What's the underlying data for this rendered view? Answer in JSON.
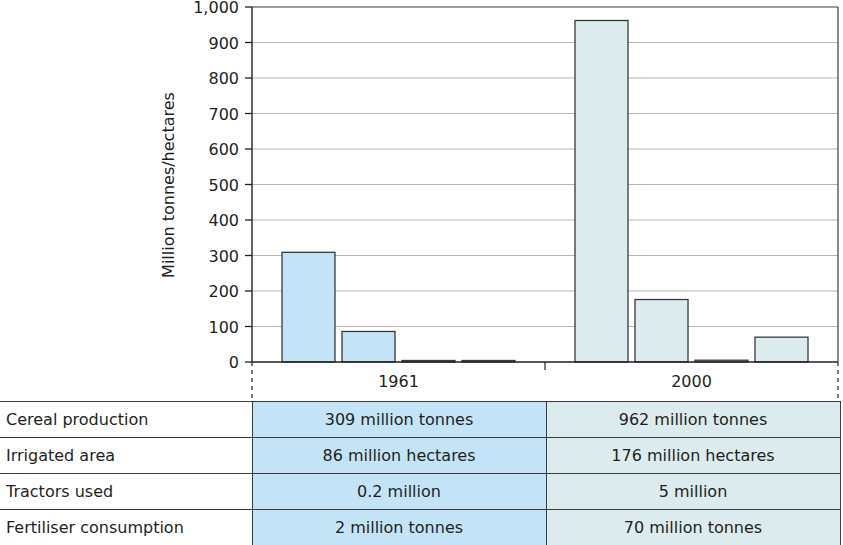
{
  "chart_data": {
    "type": "bar",
    "title": "",
    "xlabel": "",
    "ylabel": "Million tonnes/hectares",
    "ylim": [
      0,
      1000
    ],
    "yticks": [
      0,
      100,
      200,
      300,
      400,
      500,
      600,
      700,
      800,
      900,
      1000
    ],
    "ytick_labels": [
      "0",
      "100",
      "200",
      "300",
      "400",
      "500",
      "600",
      "700",
      "800",
      "900",
      "1,000"
    ],
    "grid": true,
    "categories": [
      "1961",
      "2000"
    ],
    "series": [
      {
        "name": "Cereal production",
        "values": [
          309,
          962
        ]
      },
      {
        "name": "Irrigated area",
        "values": [
          86,
          176
        ]
      },
      {
        "name": "Tractors used",
        "values": [
          0.2,
          5
        ]
      },
      {
        "name": "Fertiliser consumption",
        "values": [
          2,
          70
        ]
      }
    ],
    "category_colors": {
      "1961": "#c3e4f6",
      "2000": "#dcebee"
    },
    "bar_stroke": "#3a3a3a",
    "gridline_color": "#b5b5b5"
  },
  "table": {
    "rows": [
      {
        "label": "Cereal production",
        "v1961": "309 million tonnes",
        "v2000": "962 million tonnes"
      },
      {
        "label": "Irrigated area",
        "v1961": "86 million hectares",
        "v2000": "176 million hectares"
      },
      {
        "label": "Tractors used",
        "v1961": "0.2 million",
        "v2000": "5 million"
      },
      {
        "label": "Fertiliser consumption",
        "v1961": "2 million tonnes",
        "v2000": "70 million tonnes"
      }
    ]
  }
}
